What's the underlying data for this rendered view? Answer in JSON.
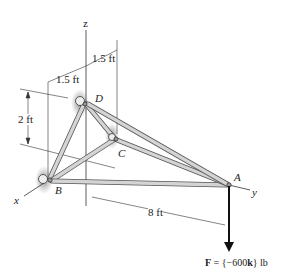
{
  "figure": {
    "axes": {
      "z": "z",
      "x": "x",
      "y": "y"
    },
    "points": {
      "A": "A",
      "B": "B",
      "C": "C",
      "D": "D"
    },
    "dimensions": {
      "top_offset": "1.5 ft",
      "left_offset": "1.5 ft",
      "height": "2 ft",
      "length": "8 ft"
    },
    "force": {
      "label_prefix": "F",
      "label_text": " = {−600",
      "unit_vector": "k",
      "label_suffix": "} lb"
    },
    "colors": {
      "member": "#c8c8c8",
      "member_edge": "#555555",
      "line": "#333333",
      "support_shadow": "#8a8a8a"
    }
  }
}
